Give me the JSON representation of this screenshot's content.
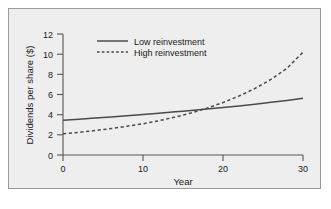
{
  "figure": {
    "background_color": "#eeeeee",
    "page_color": "#ffffff",
    "border_color": "#9a9a9a",
    "ink_color": "#4a4a4a"
  },
  "chart_data": {
    "type": "line",
    "title": "",
    "xlabel": "Year",
    "ylabel": "Dividends per share ($)",
    "xlim": [
      0,
      30
    ],
    "ylim": [
      0,
      12
    ],
    "xticks": [
      0,
      10,
      20,
      30
    ],
    "xtick_labels": [
      "0",
      "10",
      "20",
      "30"
    ],
    "yticks": [
      0,
      2,
      4,
      6,
      8,
      10,
      12
    ],
    "ytick_labels": [
      "0",
      "2",
      "4",
      "6",
      "8",
      "10",
      "12"
    ],
    "grid": false,
    "legend_position": "top-center",
    "x": [
      0,
      2,
      4,
      6,
      8,
      10,
      12,
      14,
      15,
      16,
      18,
      20,
      22,
      24,
      26,
      28,
      30
    ],
    "series": [
      {
        "name": "Low reinvestment",
        "style": "solid",
        "values": [
          3.45,
          3.55,
          3.66,
          3.77,
          3.89,
          4.01,
          4.14,
          4.28,
          4.35,
          4.42,
          4.56,
          4.71,
          4.87,
          5.04,
          5.22,
          5.41,
          5.62
        ]
      },
      {
        "name": "High reinvestment",
        "style": "dashed",
        "values": [
          2.1,
          2.25,
          2.42,
          2.62,
          2.85,
          3.1,
          3.4,
          3.76,
          3.96,
          4.17,
          4.65,
          5.2,
          5.85,
          6.6,
          7.5,
          8.6,
          10.2
        ]
      }
    ],
    "legend_entries": [
      {
        "label": "Low reinvestment",
        "style": "solid"
      },
      {
        "label": "High reinvestment",
        "style": "dashed"
      }
    ],
    "annotations": []
  },
  "axes_geometry": {
    "x_pixel_min": 63,
    "x_pixel_max": 303,
    "y_pixel_zero": 155,
    "y_pixel_max": 34
  }
}
